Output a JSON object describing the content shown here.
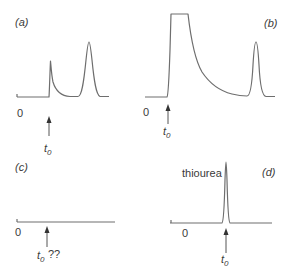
{
  "figure": {
    "panels": [
      {
        "id": "a",
        "label": "(a)",
        "zero_label": "0",
        "marker_label": "t",
        "marker_subscript": "0",
        "marker_suffix": "",
        "description": "Baseline disturbance spike at t0 followed by analyte peak"
      },
      {
        "id": "b",
        "label": "(b)",
        "zero_label": "0",
        "marker_label": "t",
        "marker_subscript": "0",
        "marker_suffix": "",
        "description": "Large off-scale (flat-topped) solvent front at t0 with tailing decay, followed by analyte peak"
      },
      {
        "id": "c",
        "label": "(c)",
        "zero_label": "0",
        "marker_label": "t",
        "marker_subscript": "0",
        "marker_suffix": " ??",
        "description": "Flat baseline with no visible disturbance; t0 uncertain"
      },
      {
        "id": "d",
        "label": "(d)",
        "zero_label": "0",
        "marker_label": "t",
        "marker_subscript": "0",
        "marker_suffix": "",
        "peak_label": "thiourea",
        "description": "Narrow unretained marker peak (thiourea) at t0"
      }
    ]
  },
  "colors": {
    "trace": "#6e6e6e",
    "text": "#3a3a3a",
    "arrow": "#333333",
    "background": "#ffffff"
  }
}
